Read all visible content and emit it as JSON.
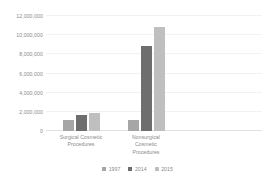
{
  "chart_data": {
    "type": "bar",
    "title": "",
    "subtitle": "",
    "xlabel": "",
    "ylabel": "",
    "categories": [
      "Surgical Cosmetic Procedures",
      "Nonsurgical Cosmetic Procedures"
    ],
    "series": [
      {
        "name": "1997",
        "color": "#a6a6a6",
        "values": [
          1100000,
          1100000
        ]
      },
      {
        "name": "2014",
        "color": "#6e6e6e",
        "values": [
          1700000,
          8900000
        ]
      },
      {
        "name": "2015",
        "color": "#bfbfbf",
        "values": [
          1900000,
          10900000
        ]
      }
    ],
    "ylim": [
      0,
      12000000
    ],
    "y_tick_values": [
      0,
      2000000,
      4000000,
      6000000,
      8000000,
      10000000,
      12000000
    ],
    "y_tick_labels": [
      "0",
      "2,000,000",
      "4,000,000",
      "6,000,000",
      "8,000,000",
      "10,000,000",
      "12,000,000"
    ],
    "grid": true,
    "grid_axis": "y",
    "legend_position": "bottom",
    "annotations": [],
    "colors": {
      "gridline": "#f2f2f2",
      "baseline": "#e2e2e2",
      "text": "#8a8a8a",
      "background": "#ffffff"
    }
  },
  "category_label_lines": [
    [
      "Surgical Cosmetic",
      "Procedures"
    ],
    [
      "Nonsurgical",
      "Cosmetic",
      "Procedures"
    ]
  ]
}
